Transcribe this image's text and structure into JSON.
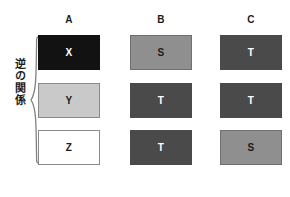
{
  "diagram": {
    "annotation": {
      "label": "逆の関係",
      "brace_icon": "curly-brace-icon"
    },
    "columns": [
      {
        "header": "A"
      },
      {
        "header": "B"
      },
      {
        "header": "C"
      }
    ],
    "cells": [
      [
        {
          "text": "X",
          "shade": "black",
          "fill": "#121212",
          "text_color": "#ffffff"
        },
        {
          "text": "S",
          "shade": "medgray",
          "fill": "#8f8f8f",
          "text_color": "#1c1c1c"
        },
        {
          "text": "T",
          "shade": "darkgray",
          "fill": "#4a4a4a",
          "text_color": "#ffffff"
        }
      ],
      [
        {
          "text": "Y",
          "shade": "lightgray",
          "fill": "#c9c9c9",
          "text_color": "#1c1c1c"
        },
        {
          "text": "T",
          "shade": "darkgray",
          "fill": "#4a4a4a",
          "text_color": "#ffffff"
        },
        {
          "text": "T",
          "shade": "darkgray",
          "fill": "#4a4a4a",
          "text_color": "#ffffff"
        }
      ],
      [
        {
          "text": "Z",
          "shade": "white",
          "fill": "#ffffff",
          "text_color": "#1c1c1c"
        },
        {
          "text": "T",
          "shade": "darkgray",
          "fill": "#4a4a4a",
          "text_color": "#ffffff"
        },
        {
          "text": "S",
          "shade": "medgray",
          "fill": "#8f8f8f",
          "text_color": "#1c1c1c"
        }
      ]
    ]
  }
}
